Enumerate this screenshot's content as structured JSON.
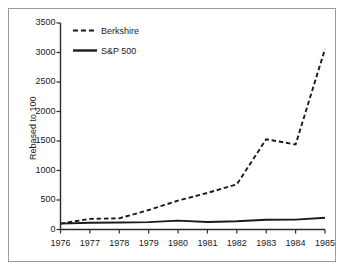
{
  "chart_data": {
    "type": "line",
    "title": "",
    "xlabel": "",
    "ylabel": "Rebased to 100",
    "x": [
      1976,
      1977,
      1978,
      1979,
      1980,
      1981,
      1982,
      1983,
      1984,
      1985
    ],
    "xtick_labels": [
      "1976",
      "1977",
      "1978",
      "1979",
      "1980",
      "1981",
      "1982",
      "1983",
      "1984",
      "1985"
    ],
    "ytick_labels": [
      "0",
      "500",
      "1000",
      "1500",
      "2000",
      "2500",
      "3000",
      "3500"
    ],
    "yticks": [
      0,
      500,
      1000,
      1500,
      2000,
      2500,
      3000,
      3500
    ],
    "ylim": [
      0,
      3500
    ],
    "xlim": [
      1976,
      1985
    ],
    "grid": false,
    "legend_position": "upper left",
    "series": [
      {
        "name": "Berkshire",
        "style": "dashed",
        "color": "#1a1a1a",
        "values": [
          100,
          180,
          190,
          330,
          490,
          620,
          765,
          1530,
          1440,
          3060
        ]
      },
      {
        "name": "S&P 500",
        "style": "solid",
        "color": "#1a1a1a",
        "values": [
          100,
          115,
          118,
          125,
          150,
          128,
          140,
          165,
          168,
          200
        ]
      }
    ]
  },
  "axis": {
    "y_title": "Rebased to 100"
  },
  "legend": {
    "items": [
      {
        "label": "Berkshire",
        "style": "dashed"
      },
      {
        "label": "S&P 500",
        "style": "solid"
      }
    ]
  }
}
